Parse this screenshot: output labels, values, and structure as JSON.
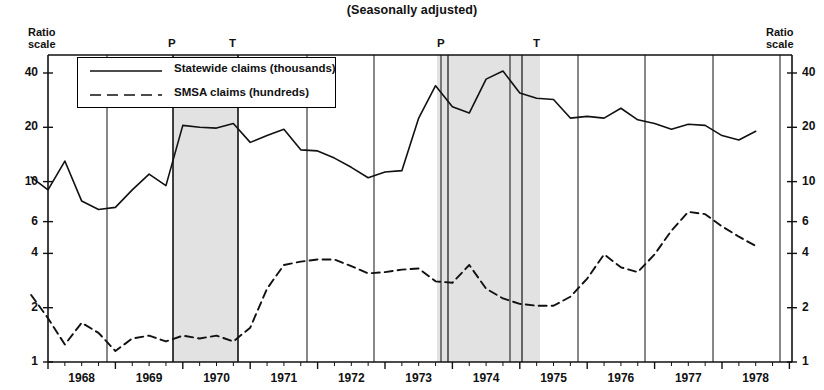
{
  "chart_data": {
    "type": "line",
    "title": "(Seasonally adjusted)",
    "xlabel": "",
    "ylabel": "Ratio scale",
    "y_axis_label_left": "Ratio\nscale",
    "y_axis_label_right": "Ratio\nscale",
    "scale": "log",
    "ylim": [
      1,
      48
    ],
    "yticks": [
      1,
      2,
      4,
      6,
      10,
      20,
      40
    ],
    "ytick_labels": [
      "1",
      "2",
      "4",
      "6",
      "10",
      "20",
      "40"
    ],
    "grid": "vertical year gridlines only",
    "legend_position": "upper left inside plot",
    "x": [
      "1967Q4",
      "1968Q1",
      "1968Q2",
      "1968Q3",
      "1968Q4",
      "1969Q1",
      "1969Q2",
      "1969Q3",
      "1969Q4",
      "1970Q1",
      "1970Q2",
      "1970Q3",
      "1970Q4",
      "1971Q1",
      "1971Q2",
      "1971Q3",
      "1971Q4",
      "1972Q1",
      "1972Q2",
      "1972Q3",
      "1972Q4",
      "1973Q1",
      "1973Q2",
      "1973Q3",
      "1973Q4",
      "1974Q1",
      "1974Q2",
      "1974Q3",
      "1974Q4",
      "1975Q1",
      "1975Q2",
      "1975Q3",
      "1975Q4",
      "1976Q1",
      "1976Q2",
      "1976Q3",
      "1976Q4",
      "1977Q1",
      "1977Q2",
      "1977Q3",
      "1977Q4",
      "1978Q1",
      "1978Q2",
      "1978Q3"
    ],
    "xtick_labels": [
      "1968",
      "1969",
      "1970",
      "1971",
      "1972",
      "1973",
      "1974",
      "1975",
      "1976",
      "1977",
      "1978"
    ],
    "series": [
      {
        "name": "Statewide claims (thousands)",
        "style": "solid",
        "values": [
          10.6,
          9.0,
          13.0,
          7.8,
          7.0,
          7.2,
          9.0,
          11.0,
          9.5,
          20.5,
          20.0,
          19.8,
          21.0,
          16.5,
          18.0,
          19.5,
          15.0,
          14.8,
          13.5,
          12.0,
          10.5,
          11.3,
          11.5,
          22.5,
          34.0,
          26.0,
          24.0,
          37.0,
          41.0,
          31.0,
          29.0,
          28.5,
          22.5,
          23.0,
          22.5,
          25.5,
          22.0,
          21.0,
          19.5,
          20.8,
          20.5,
          18.0,
          17.0,
          19.0
        ]
      },
      {
        "name": "SMSA claims (hundreds)",
        "style": "dashed",
        "values": [
          2.35,
          1.75,
          1.25,
          1.65,
          1.45,
          1.15,
          1.35,
          1.4,
          1.3,
          1.4,
          1.35,
          1.4,
          1.3,
          1.55,
          2.55,
          3.45,
          3.6,
          3.7,
          3.7,
          3.4,
          3.1,
          3.15,
          3.25,
          3.3,
          2.8,
          2.75,
          3.45,
          2.55,
          2.25,
          2.1,
          2.05,
          2.05,
          2.3,
          2.9,
          3.95,
          3.35,
          3.15,
          3.95,
          5.35,
          6.8,
          6.6,
          5.65,
          4.95,
          4.4
        ]
      }
    ],
    "recession_bands": [
      {
        "peak_label": "P",
        "trough_label": "T",
        "start": "1969Q4",
        "end": "1970Q4"
      },
      {
        "peak_label": "P",
        "trough_label": "T",
        "start": "1973Q4",
        "end": "1975Q1"
      }
    ],
    "annotations": [
      {
        "text": "P",
        "x": 172,
        "y": 38
      },
      {
        "text": "T",
        "x": 233,
        "y": 38
      },
      {
        "text": "P",
        "x": 441,
        "y": 38
      },
      {
        "text": "T",
        "x": 537,
        "y": 38
      }
    ],
    "colors": {
      "line": "#111111",
      "band_fill": "#e2e2e2",
      "axis": "#000000",
      "background": "#ffffff"
    }
  },
  "legend": {
    "items": [
      {
        "label": "Statewide claims (thousands)",
        "style": "solid"
      },
      {
        "label": "SMSA claims (hundreds)",
        "style": "dashed"
      }
    ]
  },
  "axes": {
    "left_caption_line1": "Ratio",
    "left_caption_line2": "scale",
    "right_caption_line1": "Ratio",
    "right_caption_line2": "scale"
  }
}
